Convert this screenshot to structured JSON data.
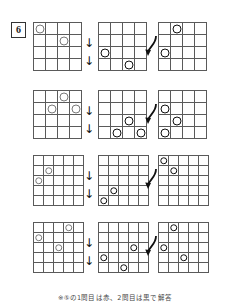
{
  "worksheet": {
    "problem_number": "6",
    "footnote": "※⑤の1問目は赤、2問目は黒で解答",
    "colors": {
      "grid_line": "#5a5a5a",
      "circle_light": "#7a7a7a",
      "circle_dark": "#111111",
      "text": "#1a1a1a"
    },
    "connectors": {
      "down_arrow": "↓",
      "curve_arrow": "curved-arrow"
    },
    "rows": [
      {
        "id": "row-1",
        "grid_size": 4,
        "panels": [
          {
            "id": "row-1-panel-1",
            "style": "light",
            "circles": [
              {
                "r": 0,
                "c": 0
              },
              {
                "r": 1,
                "c": 2
              }
            ]
          },
          {
            "id": "row-1-panel-2",
            "style": "dark",
            "circles": [
              {
                "r": 2,
                "c": 0
              },
              {
                "r": 3,
                "c": 2
              }
            ]
          },
          {
            "id": "row-1-panel-3",
            "style": "dark",
            "circles": [
              {
                "r": 0,
                "c": 1
              },
              {
                "r": 2,
                "c": 0
              }
            ]
          }
        ]
      },
      {
        "id": "row-2",
        "grid_size": 4,
        "panels": [
          {
            "id": "row-2-panel-1",
            "style": "light",
            "circles": [
              {
                "r": 0,
                "c": 2
              },
              {
                "r": 1,
                "c": 1
              },
              {
                "r": 1,
                "c": 3
              }
            ]
          },
          {
            "id": "row-2-panel-2",
            "style": "dark",
            "circles": [
              {
                "r": 2,
                "c": 2
              },
              {
                "r": 3,
                "c": 1
              },
              {
                "r": 3,
                "c": 3
              }
            ]
          },
          {
            "id": "row-2-panel-3",
            "style": "dark",
            "circles": [
              {
                "r": 1,
                "c": 0
              },
              {
                "r": 2,
                "c": 1
              },
              {
                "r": 3,
                "c": 0
              }
            ]
          }
        ]
      },
      {
        "id": "row-3",
        "grid_size": 5,
        "panels": [
          {
            "id": "row-3-panel-1",
            "style": "light",
            "circles": [
              {
                "r": 1,
                "c": 1
              },
              {
                "r": 2,
                "c": 0
              }
            ]
          },
          {
            "id": "row-3-panel-2",
            "style": "dark",
            "circles": [
              {
                "r": 3,
                "c": 1
              },
              {
                "r": 4,
                "c": 0
              }
            ]
          },
          {
            "id": "row-3-panel-3",
            "style": "dark",
            "circles": [
              {
                "r": 0,
                "c": 0
              },
              {
                "r": 1,
                "c": 1
              }
            ]
          }
        ]
      },
      {
        "id": "row-4",
        "grid_size": 5,
        "panels": [
          {
            "id": "row-4-panel-1",
            "style": "light",
            "circles": [
              {
                "r": 0,
                "c": 3
              },
              {
                "r": 1,
                "c": 0
              },
              {
                "r": 2,
                "c": 2
              }
            ]
          },
          {
            "id": "row-4-panel-2",
            "style": "dark",
            "circles": [
              {
                "r": 2,
                "c": 3
              },
              {
                "r": 3,
                "c": 0
              },
              {
                "r": 4,
                "c": 2
              }
            ]
          },
          {
            "id": "row-4-panel-3",
            "style": "dark",
            "circles": [
              {
                "r": 0,
                "c": 1
              },
              {
                "r": 2,
                "c": 0
              },
              {
                "r": 3,
                "c": 2
              }
            ]
          }
        ]
      }
    ]
  }
}
